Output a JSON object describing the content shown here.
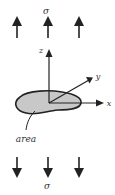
{
  "figure": {
    "width": 115,
    "height": 195,
    "background": "#ffffff",
    "stroke_color": "#222222",
    "area_fill": "#c8c8c8"
  },
  "labels": {
    "sigma_top": "σ",
    "sigma_bottom": "σ",
    "axis_z": "z",
    "axis_y": "y",
    "axis_x": "x",
    "area": "area"
  },
  "stress_arrows": {
    "top": {
      "direction": "up",
      "count": 3
    },
    "bottom": {
      "direction": "down",
      "count": 3
    }
  },
  "axes": [
    {
      "name": "z",
      "direction": "vertical-up"
    },
    {
      "name": "y",
      "direction": "oblique-up-right"
    },
    {
      "name": "x",
      "direction": "horizontal-right"
    }
  ]
}
